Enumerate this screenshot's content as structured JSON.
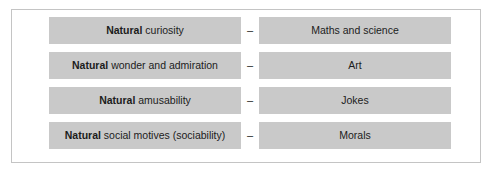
{
  "figure": {
    "border_color": "#c4c4c4",
    "background_color": "#ffffff",
    "bar_color": "#c9c9c9",
    "text_color": "#1c1c1c",
    "separator": "–",
    "rows": [
      {
        "disposition_lead": "Natural",
        "disposition_rest": " curiosity",
        "separator": "–",
        "outcome": "Maths and science"
      },
      {
        "disposition_lead": "Natural",
        "disposition_rest": " wonder and admiration",
        "separator": "–",
        "outcome": "Art"
      },
      {
        "disposition_lead": "Natural",
        "disposition_rest": " amusability",
        "separator": "–",
        "outcome": "Jokes"
      },
      {
        "disposition_lead": "Natural",
        "disposition_rest": " social motives (sociability)",
        "separator": "–",
        "outcome": "Morals"
      }
    ]
  }
}
